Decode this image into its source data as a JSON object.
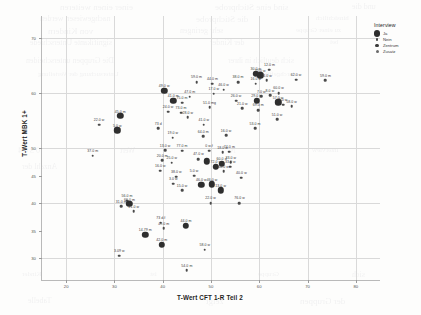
{
  "chart_data": {
    "type": "scatter",
    "title": "",
    "xlabel": "T-Wert CFT 1-R Teil 2",
    "ylabel": "T-Wert MBK 1+",
    "xlim": [
      15,
      85
    ],
    "ylim": [
      26,
      74
    ],
    "xticks": [
      20,
      30,
      40,
      50,
      60,
      70,
      80
    ],
    "xticklabels": [
      "20",
      "30",
      "40",
      "50",
      "60",
      "70",
      "80"
    ],
    "yticks": [
      30,
      35,
      40,
      45,
      50,
      60,
      70
    ],
    "yticklabels": [
      "30",
      "35",
      "40",
      "45",
      "50",
      "60",
      "70"
    ],
    "grid": true,
    "legend": {
      "title": "Interview",
      "position": "top-right",
      "entries": [
        {
          "label": "Ja",
          "marker": "large-filled-circle",
          "color": "#2e2e2e"
        },
        {
          "label": "Nein",
          "marker": "small-dot",
          "color": "#4a4a4a"
        },
        {
          "label": "Zentrum",
          "marker": "medium-circle",
          "color": "#3a3a3a"
        },
        {
          "label": "Zusatz",
          "marker": "small-circle",
          "color": "#6a6a6a"
        }
      ]
    },
    "points": [
      {
        "x": 26.8,
        "y": 54.2,
        "label": "22.0 w",
        "group": "nein"
      },
      {
        "x": 31.2,
        "y": 55.8,
        "label": "45.0 m",
        "group": "ja"
      },
      {
        "x": 30.6,
        "y": 53.2,
        "label": "5.0 w",
        "group": "ja"
      },
      {
        "x": 25.5,
        "y": 48.6,
        "label": "37.0 m",
        "group": "nein"
      },
      {
        "x": 40.3,
        "y": 60.4,
        "label": "49.0 w",
        "group": "ja"
      },
      {
        "x": 42.2,
        "y": 58.6,
        "label": "41.0 m",
        "group": "ja"
      },
      {
        "x": 39.1,
        "y": 53.6,
        "label": "73 d",
        "group": "nein"
      },
      {
        "x": 41.1,
        "y": 56.6,
        "label": "24.0 w",
        "group": "nein"
      },
      {
        "x": 43.8,
        "y": 56.4,
        "label": "73.0 m",
        "group": "nein"
      },
      {
        "x": 44.0,
        "y": 58.2,
        "label": "75.0 m",
        "group": "nein"
      },
      {
        "x": 45.6,
        "y": 59.3,
        "label": "47.0 m",
        "group": "nein"
      },
      {
        "x": 47.0,
        "y": 62.0,
        "label": "59.0 m",
        "group": "nein"
      },
      {
        "x": 42.1,
        "y": 51.9,
        "label": "19.0 w",
        "group": "nein"
      },
      {
        "x": 45.2,
        "y": 55.6,
        "label": "28.0 w",
        "group": "nein"
      },
      {
        "x": 40.5,
        "y": 49.6,
        "label": "13.0 w",
        "group": "nein"
      },
      {
        "x": 44.0,
        "y": 49.5,
        "label": "77.0 m",
        "group": "nein"
      },
      {
        "x": 39.9,
        "y": 47.8,
        "label": "20.0 m",
        "group": "nein"
      },
      {
        "x": 41.9,
        "y": 47.3,
        "label": "25.0 w",
        "group": "nein"
      },
      {
        "x": 39.5,
        "y": 45.9,
        "label": "16.0 w",
        "group": "nein"
      },
      {
        "x": 42.8,
        "y": 44.8,
        "label": "38.0 w",
        "group": "nein"
      },
      {
        "x": 42.2,
        "y": 43.5,
        "label": "3.0 w",
        "group": "nein"
      },
      {
        "x": 44.0,
        "y": 42.3,
        "label": "15.0 w",
        "group": "nein"
      },
      {
        "x": 47.4,
        "y": 48.0,
        "label": "47.0 w",
        "group": "nein"
      },
      {
        "x": 46.5,
        "y": 45.0,
        "label": "5.0 w",
        "group": "nein"
      },
      {
        "x": 48.0,
        "y": 43.3,
        "label": "46.0 w",
        "group": "ja"
      },
      {
        "x": 49.7,
        "y": 57.4,
        "label": "51.0 mg",
        "group": "nein"
      },
      {
        "x": 48.5,
        "y": 54.2,
        "label": "41.0 w",
        "group": "nein"
      },
      {
        "x": 48.4,
        "y": 52.1,
        "label": "64.0 m",
        "group": "nein"
      },
      {
        "x": 49.6,
        "y": 49.5,
        "label": "0 w.f",
        "group": "nein"
      },
      {
        "x": 49.1,
        "y": 47.6,
        "label": "",
        "group": "ja"
      },
      {
        "x": 50.6,
        "y": 59.9,
        "label": "17.0 w",
        "group": "nein"
      },
      {
        "x": 50.3,
        "y": 61.7,
        "label": "44.0 m",
        "group": "nein"
      },
      {
        "x": 52.6,
        "y": 60.6,
        "label": "46.0 w",
        "group": "nein"
      },
      {
        "x": 53.1,
        "y": 52.3,
        "label": "16.0 w",
        "group": "nein"
      },
      {
        "x": 53.8,
        "y": 49.3,
        "label": "74.0 m",
        "group": "nein"
      },
      {
        "x": 52.4,
        "y": 49.2,
        "label": "18.0 w",
        "group": "nein"
      },
      {
        "x": 54.1,
        "y": 47.4,
        "label": "33.0 w",
        "group": "nein"
      },
      {
        "x": 52.2,
        "y": 47.1,
        "label": "60.0 d",
        "group": "ja"
      },
      {
        "x": 54.0,
        "y": 46.6,
        "label": "33.0 w",
        "group": "nein"
      },
      {
        "x": 52.6,
        "y": 45.8,
        "label": "60.0 w",
        "group": "nein"
      },
      {
        "x": 51.0,
        "y": 46.6,
        "label": "72.0 w",
        "group": "ja"
      },
      {
        "x": 52.0,
        "y": 42.3,
        "label": "13.0 w",
        "group": "ja"
      },
      {
        "x": 50.2,
        "y": 43.4,
        "label": "46.0 w",
        "group": "ja"
      },
      {
        "x": 49.9,
        "y": 40.0,
        "label": "22.0 w",
        "group": "nein"
      },
      {
        "x": 55.9,
        "y": 40.0,
        "label": "76.0 w",
        "group": "nein"
      },
      {
        "x": 56.3,
        "y": 44.6,
        "label": "40.0 w",
        "group": "nein"
      },
      {
        "x": 56.5,
        "y": 57.2,
        "label": "21.0 w",
        "group": "nein"
      },
      {
        "x": 55.2,
        "y": 58.6,
        "label": "26.0 w",
        "group": "nein"
      },
      {
        "x": 55.6,
        "y": 62.0,
        "label": "38.0 m",
        "group": "nein"
      },
      {
        "x": 59.3,
        "y": 63.5,
        "label": "30.0 w",
        "group": "ja"
      },
      {
        "x": 60.2,
        "y": 63.2,
        "label": "15.0 w",
        "group": "ja"
      },
      {
        "x": 59.3,
        "y": 61.7,
        "label": "16.0 w",
        "group": "nein"
      },
      {
        "x": 62.1,
        "y": 64.2,
        "label": "12.0 m",
        "group": "nein"
      },
      {
        "x": 61.5,
        "y": 62.3,
        "label": "14.0 w",
        "group": "nein"
      },
      {
        "x": 59.5,
        "y": 58.6,
        "label": "29.0 m",
        "group": "ja"
      },
      {
        "x": 59.8,
        "y": 56.9,
        "label": "69.0 m",
        "group": "nein"
      },
      {
        "x": 60.4,
        "y": 59.4,
        "label": "7.0 w",
        "group": "nein"
      },
      {
        "x": 59.1,
        "y": 53.6,
        "label": "53.0 m",
        "group": "nein"
      },
      {
        "x": 62.2,
        "y": 59.6,
        "label": "8.0 w",
        "group": "nein"
      },
      {
        "x": 64.0,
        "y": 60.0,
        "label": "60.0 w",
        "group": "nein"
      },
      {
        "x": 63.9,
        "y": 58.3,
        "label": "57.0 w",
        "group": "ja"
      },
      {
        "x": 64.9,
        "y": 57.9,
        "label": "1.0 w",
        "group": "nein"
      },
      {
        "x": 66.7,
        "y": 57.6,
        "label": "58.0 w",
        "group": "nein"
      },
      {
        "x": 63.7,
        "y": 55.2,
        "label": "51.0 w",
        "group": "nein"
      },
      {
        "x": 67.6,
        "y": 62.4,
        "label": "62.0 w",
        "group": "nein"
      },
      {
        "x": 73.7,
        "y": 62.3,
        "label": "59.0 m",
        "group": "nein"
      },
      {
        "x": 32.6,
        "y": 40.4,
        "label": "56.0 m",
        "group": "nein"
      },
      {
        "x": 31.4,
        "y": 39.4,
        "label": "31.0 m",
        "group": "nein"
      },
      {
        "x": 33.1,
        "y": 39.8,
        "label": "66.0 m",
        "group": "ja"
      },
      {
        "x": 34.0,
        "y": 38.5,
        "label": "21.0 w",
        "group": "nein"
      },
      {
        "x": 39.6,
        "y": 36.4,
        "label": "73 d.f",
        "group": "nein"
      },
      {
        "x": 40.2,
        "y": 35.4,
        "label": "49.0 m",
        "group": "nein"
      },
      {
        "x": 44.8,
        "y": 35.9,
        "label": "44.0 m",
        "group": "ja"
      },
      {
        "x": 36.4,
        "y": 34.2,
        "label": "14.79 m",
        "group": "ja"
      },
      {
        "x": 39.8,
        "y": 32.4,
        "label": "42.0 m",
        "group": "ja"
      },
      {
        "x": 48.7,
        "y": 31.5,
        "label": "58.0 w",
        "group": "nein"
      },
      {
        "x": 31.0,
        "y": 30.4,
        "label": "3.09 w",
        "group": "nein"
      },
      {
        "x": 45.0,
        "y": 27.8,
        "label": "54.0 m",
        "group": "nein"
      }
    ]
  },
  "bleed_text": [
    {
      "t": "einer einen weiteren",
      "x": 60,
      "y": 2
    },
    {
      "t": "sind eine Stichprobe",
      "x": 215,
      "y": 2
    },
    {
      "t": "und die",
      "x": 352,
      "y": 2
    },
    {
      "t": "nachgewiesen werden",
      "x": 40,
      "y": 14
    },
    {
      "t": "die Stichprobe",
      "x": 196,
      "y": 14
    },
    {
      "t": "hinsichtlich",
      "x": 316,
      "y": 14
    },
    {
      "t": "von Kindern",
      "x": 48,
      "y": 26
    },
    {
      "t": "sehr geringen",
      "x": 180,
      "y": 26
    },
    {
      "t": "zu einer Gruppe",
      "x": 296,
      "y": 26
    },
    {
      "t": "signifikante Unterschiede",
      "x": 30,
      "y": 38
    },
    {
      "t": "der Kinder",
      "x": 210,
      "y": 38
    },
    {
      "t": "bei",
      "x": 330,
      "y": 38
    },
    {
      "t": "Die Gruppen unterscheiden",
      "x": 26,
      "y": 56
    },
    {
      "t": "sich deutlich in ihrer",
      "x": 228,
      "y": 56
    },
    {
      "t": "Untersuchung der Verteilung",
      "x": 38,
      "y": 70
    },
    {
      "t": "durchgeführt",
      "x": 260,
      "y": 70
    },
    {
      "t": "0 3 4 4",
      "x": 18,
      "y": 146
    },
    {
      "t": "Wert",
      "x": 120,
      "y": 146
    },
    {
      "t": "N",
      "x": 230,
      "y": 146
    },
    {
      "t": "Interview",
      "x": 312,
      "y": 146
    },
    {
      "t": "Anzahl der",
      "x": 22,
      "y": 162
    },
    {
      "t": "Kinder",
      "x": 22,
      "y": 270
    },
    {
      "t": "ist",
      "x": 150,
      "y": 270
    },
    {
      "t": "Gruppe",
      "x": 258,
      "y": 270
    },
    {
      "t": "sich",
      "x": 352,
      "y": 270
    },
    {
      "t": "Tabelle",
      "x": 28,
      "y": 296
    },
    {
      "t": "zeigt",
      "x": 206,
      "y": 296
    },
    {
      "t": "der Gruppen",
      "x": 300,
      "y": 296
    }
  ]
}
